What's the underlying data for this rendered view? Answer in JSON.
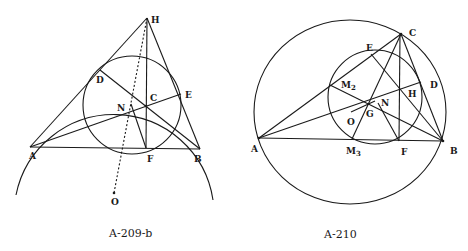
{
  "figures": [
    {
      "caption": "A-209-b",
      "points": {
        "H": "H",
        "D": "D",
        "C": "C",
        "E": "E",
        "N": "N",
        "A": "A",
        "F": "F",
        "B": "B",
        "O": "O"
      }
    },
    {
      "caption": "A-210",
      "points": {
        "C": "C",
        "E": "E",
        "D": "D",
        "M2": "M",
        "M2_sub": "2",
        "H": "H",
        "N": "N",
        "O": "O",
        "G": "G",
        "A": "A",
        "M3": "M",
        "M3_sub": "3",
        "F": "F",
        "B": "B"
      }
    }
  ],
  "colors": {
    "ink": "#1a1a1a",
    "background": "#ffffff"
  }
}
